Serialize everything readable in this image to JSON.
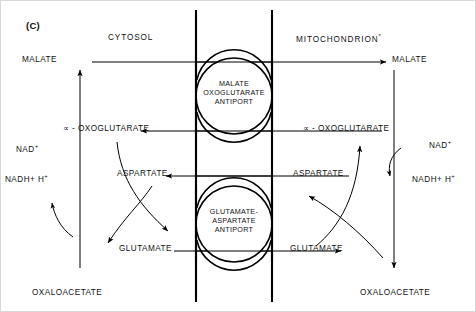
{
  "panel": {
    "tag": "(C)"
  },
  "compartments": {
    "left": "CYTOSOL",
    "right": "MITOCHONDRION",
    "right_marker": "*"
  },
  "membrane": {
    "inner_x": 196,
    "outer_x": 272,
    "top_y": 10,
    "bottom_y": 302,
    "color": "#000000"
  },
  "transporters": [
    {
      "name": "malate-oxoglutarate-antiport",
      "lines": [
        "MALATE",
        "OXOGLUTARATE",
        "ANTIPORT"
      ],
      "cx": 234,
      "cy": 93,
      "r": 38
    },
    {
      "name": "glutamate-aspartate-antiport",
      "lines": [
        "GLUTAMATE-",
        "ASPARTATE",
        "ANTIPORT"
      ],
      "cx": 234,
      "cy": 224,
      "r": 38
    }
  ],
  "cytosol": {
    "malate": "MALATE",
    "oxoglutarate": "∝ - OXOGLUTARATE",
    "aspartate": "ASPARTATE",
    "glutamate": "GLUTAMATE",
    "oxaloacetate": "OXALOACETATE",
    "nad": "NAD",
    "nad_charge": "+",
    "nadh": "NADH+ H",
    "nadh_charge": "+"
  },
  "mitochondrion": {
    "malate": "MALATE",
    "oxoglutarate": "∝ - OXOGLUTARATE",
    "aspartate": "ASPARTATE",
    "glutamate": "GLUTAMATE",
    "oxaloacetate": "OXALOACETATE",
    "nad": "NAD",
    "nad_charge": "+",
    "nadh": "NADH+ H",
    "nadh_charge": "+"
  },
  "transport_lines": [
    {
      "name": "malate-in",
      "label": "MALATE",
      "y": 62,
      "direction": "right"
    },
    {
      "name": "oxoglutarate-out",
      "label": "∝ - OXOGLUTARATE",
      "y": 131,
      "direction": "left"
    },
    {
      "name": "aspartate-out",
      "label": "ASPARTATE",
      "y": 176,
      "direction": "left"
    },
    {
      "name": "glutamate-in",
      "label": "GLUTAMATE",
      "y": 251,
      "direction": "right"
    }
  ],
  "colors": {
    "stroke": "#000000",
    "text": "#121212",
    "background": "#ffffff",
    "frame": "#d8d8d8"
  }
}
